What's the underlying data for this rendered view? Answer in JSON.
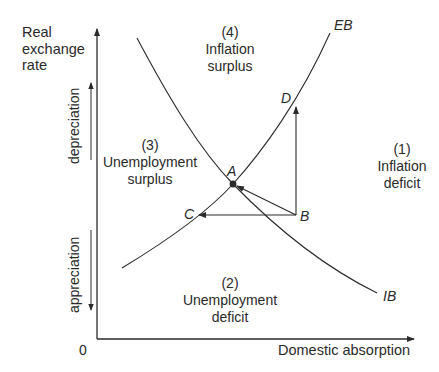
{
  "axes": {
    "y_label_line1": "Real",
    "y_label_line2": "exchange",
    "y_label_line3": "rate",
    "x_label": "Domestic absorption",
    "origin": "0",
    "up_direction": "depreciation",
    "down_direction": "appreciation"
  },
  "curves": {
    "eb": "EB",
    "ib": "IB"
  },
  "points": {
    "a": "A",
    "b": "B",
    "c": "C",
    "d": "D"
  },
  "regions": [
    {
      "number": "(1)",
      "line1": "Inflation",
      "line2": "deficit"
    },
    {
      "number": "(2)",
      "line1": "Unemployment",
      "line2": "deficit"
    },
    {
      "number": "(3)",
      "line1": "Unemployment",
      "line2": "surplus"
    },
    {
      "number": "(4)",
      "line1": "Inflation",
      "line2": "surplus"
    }
  ],
  "colors": {
    "ink": "#2a2a2a",
    "background": "#ffffff"
  }
}
